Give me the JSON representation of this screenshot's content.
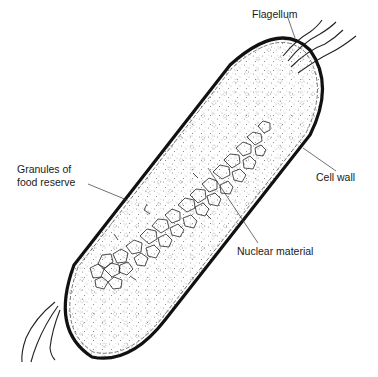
{
  "diagram": {
    "labels": {
      "flagellum": "Flagellum",
      "granules_line1": "Granules of",
      "granules_line2": "food reserve",
      "cell_wall": "Cell wall",
      "nuclear_material": "Nuclear material"
    },
    "colors": {
      "outline": "#111111",
      "stipple": "#8a8a8a",
      "nucleus": "#222222",
      "background": "#ffffff"
    }
  }
}
